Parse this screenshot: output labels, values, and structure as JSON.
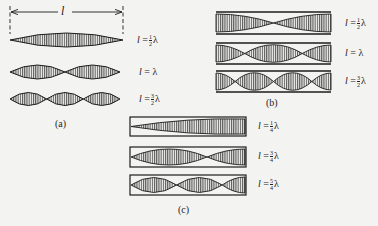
{
  "figure": {
    "dimension_label": "l",
    "panels": {
      "a": {
        "caption": "(a)",
        "rows": [
          {
            "l": "l",
            "eq": "=",
            "num": "1",
            "den": "2",
            "lambda": "λ",
            "text": "l = ½λ",
            "loops": 1
          },
          {
            "l": "l",
            "eq": "=",
            "whole": "λ",
            "text": "l = λ",
            "loops": 2
          },
          {
            "l": "l",
            "eq": "=",
            "num": "3",
            "den": "2",
            "lambda": "λ",
            "text": "l = 3/2 λ",
            "loops": 3
          }
        ]
      },
      "b": {
        "caption": "(b)",
        "rows": [
          {
            "l": "l",
            "eq": "=",
            "num": "1",
            "den": "2",
            "lambda": "λ",
            "text": "l = ½λ",
            "loops": 1
          },
          {
            "l": "l",
            "eq": "=",
            "whole": "λ",
            "text": "l = λ",
            "loops": 2
          },
          {
            "l": "l",
            "eq": "=",
            "num": "3",
            "den": "2",
            "lambda": "λ",
            "text": "l = 3/2 λ",
            "loops": 3
          }
        ]
      },
      "c": {
        "caption": "(c)",
        "rows": [
          {
            "l": "l",
            "eq": "=",
            "num": "1",
            "den": "4",
            "lambda": "λ",
            "text": "l = ¼λ",
            "quarter_loops": 1
          },
          {
            "l": "l",
            "eq": "=",
            "num": "3",
            "den": "4",
            "lambda": "λ",
            "text": "l = ¾λ",
            "quarter_loops": 3
          },
          {
            "l": "l",
            "eq": "=",
            "num": "5",
            "den": "4",
            "lambda": "λ",
            "text": "l = 5/4 λ",
            "quarter_loops": 5
          }
        ]
      }
    },
    "colors": {
      "ink": "#1d1d1d",
      "background": "#f3f3f1"
    }
  }
}
